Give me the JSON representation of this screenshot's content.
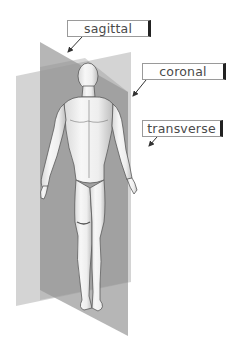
{
  "figure": {
    "labels": [
      {
        "id": "sagittal",
        "text": "sagittal"
      },
      {
        "id": "coronal",
        "text": "coronal"
      },
      {
        "id": "transverse",
        "text": "transverse"
      }
    ]
  },
  "colors": {
    "background": "#ffffff",
    "sagittal_plane": "#9c9c9c",
    "coronal_plane": "#c8c8c8",
    "overlap": "#8a8a8a",
    "figure_skin": "#f2f2f2",
    "figure_shade": "#b5b5b5",
    "figure_outline": "#5a5a5a",
    "label_border": "#9a9a9a",
    "label_text": "#4a4a4a",
    "arrow": "#333333"
  }
}
